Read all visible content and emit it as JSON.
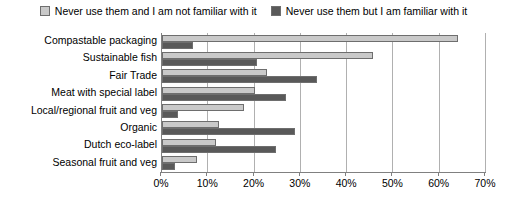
{
  "chart_data": {
    "type": "bar",
    "orientation": "horizontal",
    "title": "",
    "xlabel": "",
    "ylabel": "",
    "xlim": [
      0,
      70
    ],
    "xunit": "%",
    "xticks": [
      "0%",
      "10%",
      "20%",
      "30%",
      "40%",
      "50%",
      "60%",
      "70%"
    ],
    "xtick_values": [
      0,
      10,
      20,
      30,
      40,
      50,
      60,
      70
    ],
    "grid": true,
    "grid_axis": "x",
    "legend_position": "top",
    "categories": [
      "Compastable packaging",
      "Sustainable fish",
      "Fair Trade",
      "Meat with special label",
      "Local/regional fruit and veg",
      "Organic",
      "Dutch eco-label",
      "Seasonal fruit and veg"
    ],
    "series": [
      {
        "name": "Never use them and I am not familiar with it",
        "color": "#c9c9c9",
        "values": [
          64,
          45.5,
          22.7,
          20,
          17.7,
          12.3,
          11.7,
          7.5
        ]
      },
      {
        "name": "Never use them but I am familiar with it",
        "color": "#595959",
        "values": [
          6.7,
          20.5,
          33.5,
          26.8,
          3.5,
          28.7,
          24.6,
          2.8
        ]
      }
    ]
  },
  "colors": {
    "series_light": "#c9c9c9",
    "series_dark": "#595959",
    "bar_outline": "#6e6e6e",
    "gridline": "#b0b0b0",
    "axis": "#808080",
    "text": "#000000",
    "background": "#ffffff"
  }
}
